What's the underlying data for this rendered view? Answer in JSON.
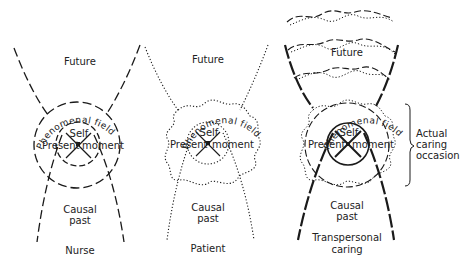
{
  "panels": [
    {
      "id": "nurse",
      "future_label": "Future",
      "field_label": "Phenomenal field",
      "self_label": "Self",
      "present_label": "Present",
      "moment_label": "moment",
      "past_label_line1": "Causal",
      "past_label_line2": "past",
      "caption": "Nurse",
      "line_style": "long-dash"
    },
    {
      "id": "patient",
      "future_label": "Future",
      "field_label": "Phenomenal field",
      "self_label": "Self",
      "present_label": "Present",
      "moment_label": "moment",
      "past_label_line1": "Causal",
      "past_label_line2": "past",
      "caption": "Patient",
      "line_style": "dotted"
    },
    {
      "id": "transpersonal",
      "future_label": "Future",
      "field_label": "Phenomenal field",
      "self_label": "Self",
      "present_label": "Present",
      "moment_label": "moment",
      "past_label_line1": "Causal",
      "past_label_line2": "past",
      "caption_line1": "Transpersonal",
      "caption_line2": "caring",
      "line_style": "bold-dash + dotted combined",
      "bracket_label_line1": "Actual",
      "bracket_label_line2": "caring",
      "bracket_label_line3": "occasion"
    }
  ],
  "colors": {
    "ink": "#1a1a1a",
    "background": "#ffffff"
  }
}
